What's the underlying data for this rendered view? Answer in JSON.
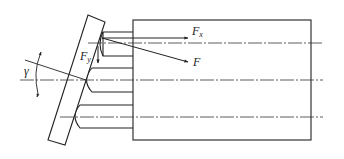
{
  "diagram": {
    "type": "mechanical-force-diagram",
    "colors": {
      "stroke": "#222222",
      "background": "#ffffff"
    },
    "labels": {
      "fx": "F",
      "fx_sub": "x",
      "f": "F",
      "fy": "F",
      "fy_sub": "y",
      "gamma": "γ"
    },
    "components": [
      {
        "name": "swash-plate",
        "shape": "inclined rectangle"
      },
      {
        "name": "cylinder-block",
        "shape": "rectangle"
      },
      {
        "name": "piston-top"
      },
      {
        "name": "piston-middle"
      },
      {
        "name": "piston-bottom"
      }
    ],
    "forces": [
      {
        "name": "F",
        "direction": "down-right along plate normal"
      },
      {
        "name": "Fx",
        "direction": "horizontal, axial"
      },
      {
        "name": "Fy",
        "direction": "vertical, downward"
      }
    ],
    "angle": {
      "name": "γ",
      "meaning": "swash plate inclination angle"
    }
  }
}
